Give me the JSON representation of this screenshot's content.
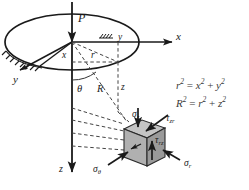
{
  "figure": {
    "background_color": "#ffffff",
    "line_color": "#1a1a1a",
    "dash_color": "#555555",
    "cube_face_light": "#c9c9c9",
    "cube_face_mid": "#a8a8a8",
    "cube_face_dark": "#8d8d8d"
  },
  "labels": {
    "load": "P",
    "axis_x": "x",
    "axis_y": "y",
    "axis_z_top": "z",
    "axis_z_bottom": "z",
    "radial_x": "x",
    "radial_y": "y",
    "radial_r": "r",
    "slant_R": "R",
    "angle_theta": "θ",
    "depth_z": "z"
  },
  "stresses": [
    {
      "name": "sigma-z",
      "text": "σ",
      "sub": "z",
      "x": 132,
      "y": 117
    },
    {
      "name": "tau-zr",
      "text": "τ",
      "sub": "zr",
      "x": 163,
      "y": 121
    },
    {
      "name": "tau-rz",
      "text": "τ",
      "sub": "rz",
      "x": 153,
      "y": 142
    },
    {
      "name": "sigma-r",
      "text": "σ",
      "sub": "r",
      "x": 177,
      "y": 165
    },
    {
      "name": "sigma-theta",
      "text": "σ",
      "sub": "θ",
      "x": 97,
      "y": 167
    }
  ],
  "equations": [
    {
      "lhs": "r",
      "lhs_sup": "2",
      "op": "=",
      "t1": "x",
      "t1_sup": "2",
      "plus": "+",
      "t2": "y",
      "t2_sup": "2"
    },
    {
      "lhs": "R",
      "lhs_sup": "2",
      "op": "=",
      "t1": "r",
      "t1_sup": "2",
      "plus": "+",
      "t2": "z",
      "t2_sup": "2"
    }
  ],
  "equation_strings": [
    "r² = x² + y²",
    "R² = r² + z²"
  ],
  "geometry": {
    "ellipse_center_x": 72,
    "ellipse_center_y": 42,
    "ellipse_rx": 67,
    "ellipse_ry": 28,
    "origin_x": 72,
    "origin_y": 42,
    "cube_center_x": 140,
    "cube_center_y": 145
  }
}
